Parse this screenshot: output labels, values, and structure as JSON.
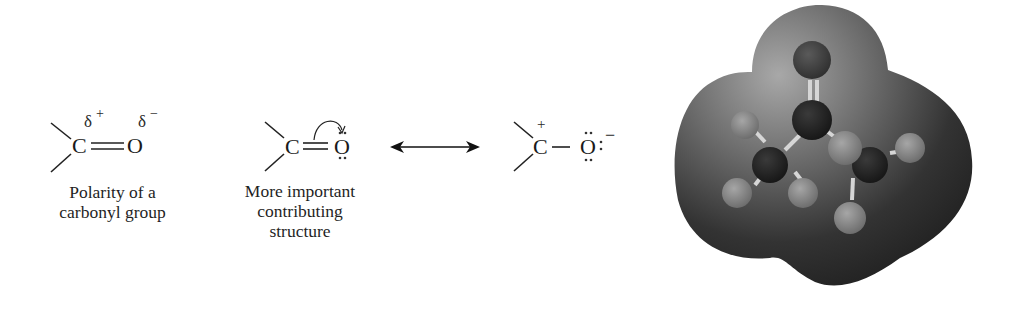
{
  "figure": {
    "structure_polarity": {
      "carbon": "C",
      "oxygen": "O",
      "bond": "double",
      "partial_positive": "δ",
      "partial_positive_sign": "+",
      "partial_negative": "δ",
      "partial_negative_sign": "−",
      "caption_line1": "Polarity of a",
      "caption_line2": "carbonyl group"
    },
    "structure_major": {
      "carbon": "C",
      "oxygen": "O",
      "bond": "double",
      "oxygen_lone_pairs": 2,
      "curved_arrow": "pi-bond-to-oxygen",
      "caption_line1": "More important",
      "caption_line2": "contributing",
      "caption_line3": "structure"
    },
    "resonance_arrow": "double-headed-arrow",
    "structure_minor": {
      "carbon": "C",
      "carbon_charge": "+",
      "oxygen": "O",
      "oxygen_charge": "−",
      "bond": "single",
      "oxygen_lone_pairs": 3
    },
    "model": {
      "type": "electrostatic-potential-map",
      "molecule": "acetone",
      "colors": {
        "surface_dark": "#2a2a2a",
        "surface_light": "#9a9a9a",
        "oxygen_atom": "#4a4a4a",
        "carbon_atom": "#262626",
        "hydrogen_atom": "#8c8c8c",
        "bond": "#d8d8d8"
      }
    }
  }
}
